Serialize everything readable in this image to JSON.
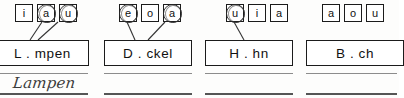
{
  "worksheet": {
    "type": "vowel-selection-exercise",
    "language": "German",
    "groups": [
      {
        "id": "group-1",
        "vowels": [
          {
            "letter": "i",
            "circled": false
          },
          {
            "letter": "a",
            "circled": true
          },
          {
            "letter": "u",
            "circled": true
          }
        ],
        "word": "L . mpen",
        "handwritten_answer": "Lampen",
        "has_connectors": true,
        "connector_count": 2
      },
      {
        "id": "group-2",
        "vowels": [
          {
            "letter": "e",
            "circled": true
          },
          {
            "letter": "o",
            "circled": false
          },
          {
            "letter": "a",
            "circled": true
          }
        ],
        "word": "D . ckel",
        "handwritten_answer": "",
        "has_connectors": true,
        "connector_count": 2
      },
      {
        "id": "group-3",
        "vowels": [
          {
            "letter": "u",
            "circled": true
          },
          {
            "letter": "i",
            "circled": false
          },
          {
            "letter": "a",
            "circled": false
          }
        ],
        "word": "H . hn",
        "handwritten_answer": "",
        "has_connectors": true,
        "connector_count": 1
      },
      {
        "id": "group-4",
        "vowels": [
          {
            "letter": "a",
            "circled": false
          },
          {
            "letter": "o",
            "circled": false
          },
          {
            "letter": "u",
            "circled": false
          }
        ],
        "word": "B . ch",
        "handwritten_answer": "",
        "has_connectors": false,
        "connector_count": 0
      }
    ]
  },
  "colors": {
    "ink": "#1b1b1b",
    "pencil": "#343434",
    "paper": "#fdfdfc",
    "rule_line": "#555555"
  }
}
